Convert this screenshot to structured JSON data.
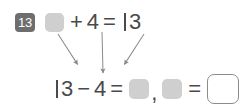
{
  "problem": {
    "number": "13",
    "top_equation": {
      "tokens": [
        {
          "type": "blank-filled",
          "text": ""
        },
        {
          "type": "operator",
          "text": "+"
        },
        {
          "type": "number",
          "text": "4"
        },
        {
          "type": "operator",
          "text": "="
        },
        {
          "type": "number",
          "text": "13"
        }
      ],
      "plus_sign": "+",
      "equals_sign": "=",
      "addend": "4",
      "sum": "13",
      "sum_ones_digit": "3"
    },
    "bottom_equation": {
      "minuend": "13",
      "minuend_ones_digit": "3",
      "minus_sign": "−",
      "subtrahend": "4",
      "equals_sign": "=",
      "comma": ",",
      "second_equals_sign": "="
    },
    "arrows": [
      {
        "name": "arrow-left",
        "from_x": 58,
        "from_y": 34,
        "to_x": 61,
        "to_y": 72
      },
      {
        "name": "arrow-center",
        "from_x": 102,
        "from_y": 32,
        "to_x": 103,
        "to_y": 75
      },
      {
        "name": "arrow-right",
        "from_x": 144,
        "from_y": 34,
        "to_x": 140,
        "to_y": 73
      }
    ]
  },
  "colors": {
    "badge_background": "#6e6e6e",
    "badge_text": "#ffffff",
    "text": "#4a4a4a",
    "blank_fill": "#cfcfcf",
    "box_border": "#8c8c8c",
    "arrow": "#8a8a8a",
    "page_background": "#ffffff"
  }
}
